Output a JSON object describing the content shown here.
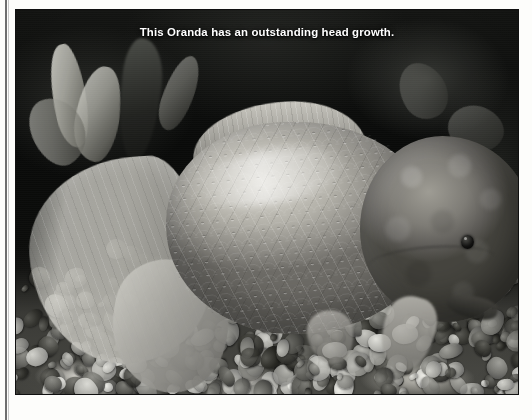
{
  "photo": {
    "caption": "This Oranda has an outstanding head growth.",
    "credit": "PHOTO BY FRED ROSENZWEIG",
    "subject": "oranda-goldfish",
    "palette": {
      "page_background": "#fdfdfb",
      "photo_background": "#0a0a0a",
      "caption_color": "#ffffff",
      "credit_color": "#1c1c1c",
      "rule_color": "#6e6e6e",
      "fish_body_light": "#d8d6ce",
      "fish_body_mid": "#9a9891",
      "fish_body_dark": "#6b6a65",
      "wen_light": "#9e9c94",
      "wen_dark": "#46453f",
      "gravel_light": "#cfcdc6",
      "gravel_dark": "#3a3a36"
    },
    "elements": {
      "tail_fin": "caudal-fin",
      "dorsal_fin": "dorsal-fin",
      "pectoral_fin": "pectoral-fin",
      "pelvic_fin": "pelvic-fin",
      "head_growth": "wen",
      "eye": "fish-eye",
      "mouth": "fish-mouth",
      "substrate": "aquarium-gravel",
      "background": "aquarium-plants"
    }
  }
}
